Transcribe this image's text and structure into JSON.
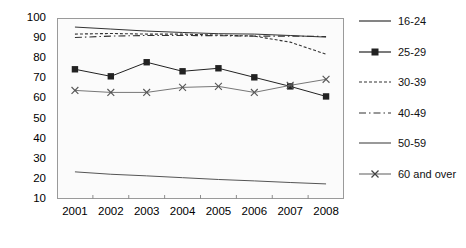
{
  "chart_data": {
    "type": "line",
    "title": "",
    "xlabel": "",
    "ylabel": "",
    "categories": [
      "2001",
      "2002",
      "2003",
      "2004",
      "2005",
      "2006",
      "2007",
      "2008"
    ],
    "ylim": [
      10,
      100
    ],
    "yticks": [
      10,
      20,
      30,
      40,
      50,
      60,
      70,
      80,
      90,
      100
    ],
    "grid": false,
    "legend_position": "right",
    "series": [
      {
        "name": "16-24",
        "style": "solid",
        "marker": "none",
        "color": "#333333",
        "values": [
          95.5,
          94.5,
          93.5,
          92.8,
          92.2,
          92.0,
          91.3,
          90.5
        ]
      },
      {
        "name": "25-29",
        "style": "solid",
        "marker": "square",
        "color": "#222222",
        "values": [
          74.5,
          71.0,
          78.0,
          73.5,
          75.0,
          70.5,
          66.0,
          61.0
        ]
      },
      {
        "name": "30-39",
        "style": "dotted",
        "marker": "none",
        "color": "#333333",
        "values": [
          92.0,
          92.3,
          92.0,
          92.0,
          91.5,
          91.0,
          88.0,
          82.0
        ]
      },
      {
        "name": "40-49",
        "style": "dashdot",
        "marker": "none",
        "color": "#333333",
        "values": [
          90.3,
          91.0,
          91.3,
          91.3,
          91.2,
          91.0,
          91.0,
          90.8
        ]
      },
      {
        "name": "50-59",
        "style": "solid",
        "marker": "none",
        "color": "#555555",
        "values": [
          23.5,
          22.3,
          21.5,
          20.6,
          19.7,
          19.0,
          18.2,
          17.5
        ]
      },
      {
        "name": "60 and over",
        "style": "solid",
        "marker": "cross",
        "color": "#777777",
        "values": [
          64.0,
          63.0,
          63.0,
          65.5,
          66.0,
          63.0,
          66.5,
          69.5
        ]
      }
    ]
  },
  "legend": {
    "items": [
      {
        "label": "16-24",
        "key": "line-plain"
      },
      {
        "label": "25-29",
        "key": "line-square-marker"
      },
      {
        "label": "30-39",
        "key": "line-dotted"
      },
      {
        "label": "40-49",
        "key": "line-dashdot"
      },
      {
        "label": "50-59",
        "key": "line-plain-thin"
      },
      {
        "label": "60 and over",
        "key": "line-cross-marker"
      }
    ]
  }
}
